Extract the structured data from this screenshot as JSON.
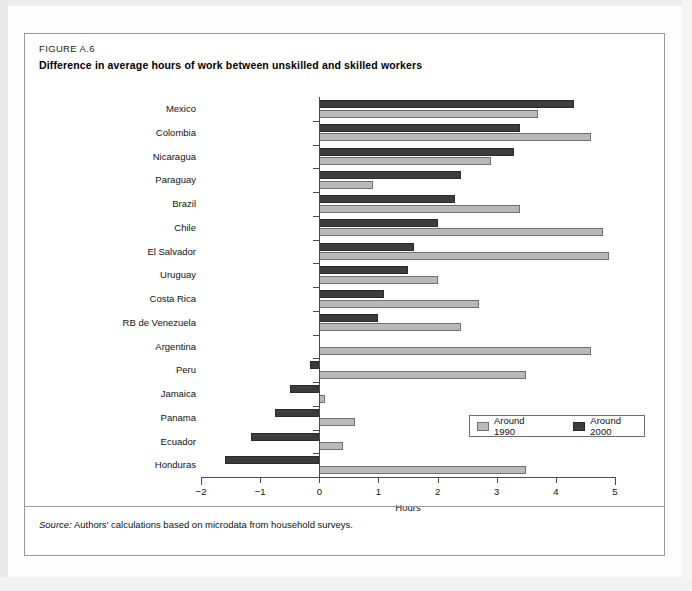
{
  "figure": {
    "label": "FIGURE A.6",
    "title": "Difference in average hours of work between unskilled and skilled workers",
    "source_word": "Source:",
    "source_text": "Authors' calculations based on microdata from household surveys."
  },
  "legend": {
    "position": "inside-bottom-right",
    "entries": [
      {
        "label": "Around 1990",
        "color": "#b9b9b9",
        "swatch": "light"
      },
      {
        "label": "Around 2000",
        "color": "#3c3c3c",
        "swatch": "dark"
      }
    ]
  },
  "axis": {
    "x_title": "Hours",
    "x_ticks": [
      "−2",
      "−1",
      "0",
      "1",
      "2",
      "3",
      "4",
      "5"
    ],
    "x_tick_values": [
      -2,
      -1,
      0,
      1,
      2,
      3,
      4,
      5
    ]
  },
  "chart_data": {
    "type": "bar",
    "orientation": "horizontal",
    "title": "Difference in average hours of work between unskilled and skilled workers",
    "subtitle": "FIGURE A.6",
    "xlabel": "Hours",
    "ylabel": "",
    "xlim": [
      -2,
      5
    ],
    "grid": false,
    "legend_position": "inside-bottom-right",
    "categories": [
      "Mexico",
      "Colombia",
      "Nicaragua",
      "Paraguay",
      "Brazil",
      "Chile",
      "El Salvador",
      "Uruguay",
      "Costa Rica",
      "RB de Venezuela",
      "Argentina",
      "Peru",
      "Jamaica",
      "Panama",
      "Ecuador",
      "Honduras"
    ],
    "series": [
      {
        "name": "Around 1990",
        "color": "#b9b9b9",
        "values": [
          3.7,
          4.6,
          2.9,
          0.9,
          3.4,
          4.8,
          4.9,
          2.0,
          2.7,
          2.4,
          4.6,
          3.5,
          0.1,
          0.6,
          0.4,
          3.5
        ]
      },
      {
        "name": "Around 2000",
        "color": "#3c3c3c",
        "values": [
          4.3,
          3.4,
          3.3,
          2.4,
          2.3,
          2.0,
          1.6,
          1.5,
          1.1,
          1.0,
          0.0,
          -0.15,
          -0.5,
          -0.75,
          -1.15,
          -1.6
        ]
      }
    ]
  }
}
